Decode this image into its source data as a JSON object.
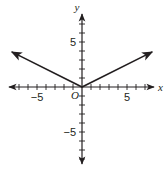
{
  "chart_data": {
    "type": "line",
    "title": "",
    "xlabel": "x",
    "ylabel": "y",
    "origin_label": "O",
    "xlim": [
      -8,
      8
    ],
    "ylim": [
      -8,
      8
    ],
    "x_tick_step": 1,
    "y_tick_step": 1,
    "x_tick_labels": [
      {
        "value": -5,
        "text": "−5"
      },
      {
        "value": 5,
        "text": "5"
      }
    ],
    "y_tick_labels": [
      {
        "value": 5,
        "text": "5"
      },
      {
        "value": -5,
        "text": "−5"
      }
    ],
    "grid": false,
    "legend": null,
    "series": [
      {
        "name": "y = |x| / 2",
        "points": [
          [
            -7.8,
            3.9
          ],
          [
            0,
            0
          ],
          [
            7.8,
            3.9
          ]
        ],
        "arrows_at_ends": true,
        "color": "#231f20"
      }
    ]
  },
  "layout": {
    "origin_px": [
      82,
      87
    ],
    "unit_px": 9,
    "x_axis_px": [
      9,
      154
    ],
    "y_axis_px": [
      14,
      164
    ]
  }
}
